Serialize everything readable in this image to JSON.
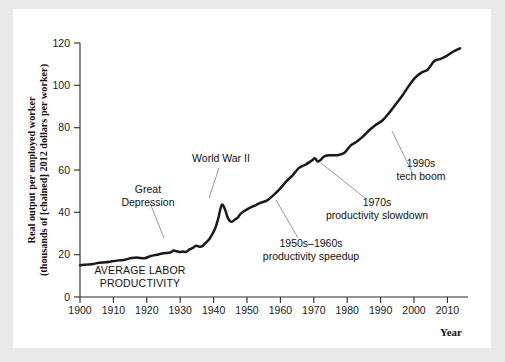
{
  "chart_data": {
    "type": "line",
    "title": "",
    "xlabel": "Year",
    "ylabel_line1": "Real output per employed worker",
    "ylabel_line2": "(thousands of [chained] 2012 dollars per worker)",
    "xlim": [
      1900,
      2018
    ],
    "ylim": [
      0,
      125
    ],
    "xticks": [
      1900,
      1910,
      1920,
      1930,
      1940,
      1950,
      1960,
      1970,
      1980,
      1990,
      2000,
      2010
    ],
    "xticklabels": [
      "1900",
      "1910",
      "1920",
      "1930",
      "1940",
      "1950",
      "1960",
      "1970",
      "1980",
      "1990",
      "2000",
      "2010"
    ],
    "yticks": [
      0,
      20,
      40,
      60,
      80,
      100,
      120
    ],
    "yticklabels": [
      "0",
      "20",
      "40",
      "60",
      "80",
      "100",
      "120"
    ],
    "grid": false,
    "legend": "none",
    "series": [
      {
        "name": "Average labor productivity",
        "color": "#1a1a1a",
        "x": [
          1900,
          1902,
          1904,
          1906,
          1908,
          1910,
          1912,
          1914,
          1916,
          1918,
          1920,
          1922,
          1924,
          1926,
          1928,
          1929,
          1930,
          1931,
          1932,
          1933,
          1934,
          1935,
          1936,
          1937,
          1938,
          1939,
          1940,
          1941,
          1942,
          1943,
          1944,
          1945,
          1946,
          1947,
          1948,
          1949,
          1950,
          1952,
          1954,
          1956,
          1958,
          1960,
          1962,
          1964,
          1966,
          1968,
          1970,
          1972,
          1973,
          1974,
          1976,
          1978,
          1980,
          1982,
          1984,
          1986,
          1988,
          1990,
          1992,
          1994,
          1996,
          1998,
          2000,
          2002,
          2004,
          2006,
          2008,
          2010,
          2012,
          2014,
          2016,
          2018
        ],
        "values": [
          15.0,
          15.3,
          15.6,
          16.2,
          16.4,
          16.9,
          17.3,
          17.6,
          18.4,
          18.6,
          18.3,
          19.4,
          20.0,
          20.7,
          21.0,
          22.0,
          21.6,
          21.3,
          21.5,
          21.3,
          22.5,
          23.2,
          24.2,
          23.8,
          24.0,
          25.6,
          27.0,
          29.5,
          32.5,
          37.5,
          43.5,
          41.5,
          37.0,
          35.5,
          36.5,
          37.5,
          39.5,
          41.5,
          43.0,
          44.5,
          45.5,
          48.0,
          51.0,
          54.5,
          57.5,
          61.0,
          62.5,
          64.5,
          65.5,
          64.0,
          66.5,
          67.0,
          67.0,
          68.0,
          71.5,
          73.5,
          76.0,
          79.0,
          81.5,
          83.5,
          87.0,
          91.0,
          95.0,
          99.5,
          103.5,
          106.0,
          107.5,
          111.5,
          112.5,
          114.0,
          116.0,
          117.5
        ]
      }
    ],
    "annotations": [
      {
        "id": "great-depression",
        "lines": [
          "Great",
          "Depression"
        ],
        "text_x": 148,
        "text_y": 193,
        "align": "middle",
        "leader": [
          [
            150,
            203
          ],
          [
            164,
            238
          ]
        ]
      },
      {
        "id": "world-war-2",
        "lines": [
          "World War II"
        ],
        "text_x": 221,
        "text_y": 162,
        "align": "middle",
        "leader": [
          [
            219,
            168
          ],
          [
            209,
            198
          ]
        ]
      },
      {
        "id": "productivity-speedup",
        "lines": [
          "1950s–1960s",
          "productivity  speedup"
        ],
        "text_x": 311,
        "text_y": 247,
        "align": "middle",
        "leader": [
          [
            298,
            238
          ],
          [
            276,
            200
          ]
        ]
      },
      {
        "id": "productivity-slowdown",
        "lines": [
          "1970s",
          "productivity slowdown"
        ],
        "text_x": 377,
        "text_y": 206,
        "align": "middle",
        "leader": [
          [
            365,
            198
          ],
          [
            321,
            163
          ]
        ]
      },
      {
        "id": "tech-boom",
        "lines": [
          "1990s",
          "tech boom"
        ],
        "text_x": 421,
        "text_y": 167,
        "align": "middle",
        "leader": [
          [
            412,
            172
          ],
          [
            392,
            131
          ]
        ]
      },
      {
        "id": "average-labor-productivity",
        "lines": [
          "AVERAGE LABOR",
          "PRODUCTIVITY"
        ],
        "text_x": 140,
        "text_y": 274,
        "align": "middle",
        "leader": null
      }
    ]
  }
}
